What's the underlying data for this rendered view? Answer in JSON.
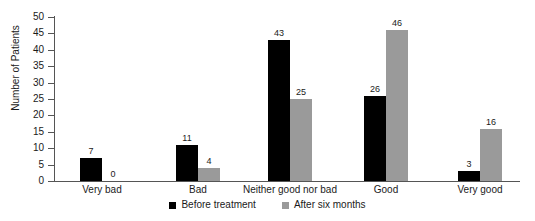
{
  "chart_data": {
    "type": "bar",
    "title": "",
    "xlabel": "",
    "ylabel": "Number of Patients",
    "categories": [
      "Very bad",
      "Bad",
      "Neither good nor bad",
      "Good",
      "Very good"
    ],
    "series": [
      {
        "name": "Before treatment",
        "color": "#000000",
        "values": [
          7,
          11,
          43,
          26,
          3
        ]
      },
      {
        "name": "After six months",
        "color": "#9a9a9a",
        "values": [
          0,
          4,
          25,
          46,
          16
        ]
      }
    ],
    "ylim": [
      0,
      50
    ],
    "yticks": [
      0,
      5,
      10,
      15,
      20,
      25,
      30,
      35,
      40,
      45,
      50
    ],
    "ytick_labels": [
      "0",
      "5",
      "10",
      "15",
      "20",
      "25",
      "30",
      "35",
      "40",
      "45",
      "50"
    ],
    "grid": false,
    "legend_position": "bottom",
    "data_labels": [
      [
        "7",
        "0"
      ],
      [
        "11",
        "4"
      ],
      [
        "43",
        "25"
      ],
      [
        "26",
        "46"
      ],
      [
        "3",
        "16"
      ]
    ]
  }
}
